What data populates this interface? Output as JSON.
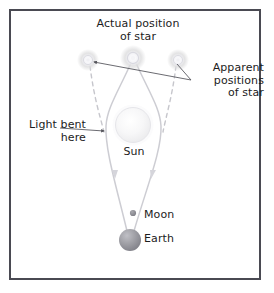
{
  "figure": {
    "title_label": "Actual position\nof star",
    "apparent_label": "Apparent\npositions\nof star",
    "light_bent_label": "Light bent\nhere",
    "sun_label": "Sun",
    "moon_label": "Moon",
    "earth_label": "Earth",
    "border_color": "#4a4a52",
    "background_color": "#ffffff",
    "text_color": "#1c1c1c",
    "ray_color": "#c9c9cf",
    "dashed_ray_color": "#c9c9cf",
    "leader_color": "#55555c",
    "star_color": "#e2e2ea",
    "sun_color": "#f2f2f4",
    "earth_color": "#9a9aa0",
    "moon_color": "#8c8c92"
  },
  "diagram_objects": [
    {
      "name": "actual-star",
      "label": "Actual position of star",
      "x": 133,
      "y": 58,
      "radius": 6
    },
    {
      "name": "apparent-star-left",
      "label": "Apparent position of star (left)",
      "x": 88,
      "y": 60,
      "radius": 5
    },
    {
      "name": "apparent-star-right",
      "label": "Apparent position of star (right)",
      "x": 178,
      "y": 60,
      "radius": 5
    },
    {
      "name": "sun",
      "label": "Sun",
      "x": 133,
      "y": 125,
      "radius": 18
    },
    {
      "name": "moon",
      "label": "Moon",
      "x": 133,
      "y": 213,
      "radius": 3
    },
    {
      "name": "earth",
      "label": "Earth",
      "x": 130,
      "y": 240,
      "radius": 11
    }
  ]
}
